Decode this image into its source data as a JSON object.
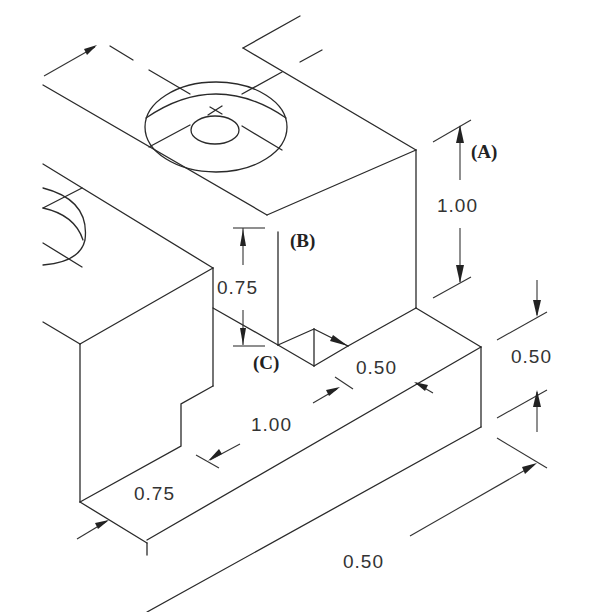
{
  "drawing": {
    "type": "isometric technical drawing",
    "labels": {
      "A": "(A)",
      "B": "(B)",
      "C": "(C)"
    },
    "dimensions": {
      "height_right_block": "1.00",
      "step_height_left": "0.75",
      "slot_width": "0.50",
      "right_ledge_height": "0.50",
      "length_front": "1.00",
      "depth_left_front": "0.75",
      "overall_right_depth": "0.50"
    }
  }
}
